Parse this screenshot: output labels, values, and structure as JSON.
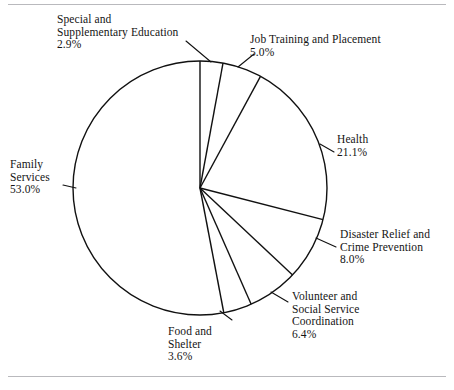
{
  "figure": {
    "background": "#ffffff",
    "stroke_color": "#111111",
    "rule_color": "#b9b9bd"
  },
  "chart_data": {
    "type": "pie",
    "title": "",
    "subtitle": "",
    "xlabel": "",
    "ylabel": "",
    "legend_position": "none",
    "grid": false,
    "units": "percent",
    "start_angle_deg": 0,
    "direction": "clockwise",
    "filled": false,
    "total": 100.0,
    "categories": [
      "Special and Supplementary Education",
      "Job Training and Placement",
      "Health",
      "Disaster Relief and Crime Prevention",
      "Volunteer and Social Service Coordination",
      "Food and Shelter",
      "Family Services"
    ],
    "values": [
      2.9,
      5.0,
      21.1,
      8.0,
      6.4,
      3.6,
      53.0
    ],
    "slices": [
      {
        "name": "Special and Supplementary Education",
        "value": 2.9,
        "value_label": "2.9%",
        "label_lines": [
          "Special and",
          "Supplementary Education"
        ],
        "start_deg": 0.0,
        "end_deg": 10.44
      },
      {
        "name": "Job Training and Placement",
        "value": 5.0,
        "value_label": "5.0%",
        "label_lines": [
          "Job Training and Placement"
        ],
        "start_deg": 10.44,
        "end_deg": 28.44
      },
      {
        "name": "Health",
        "value": 21.1,
        "value_label": "21.1%",
        "label_lines": [
          "Health"
        ],
        "start_deg": 28.44,
        "end_deg": 104.4
      },
      {
        "name": "Disaster Relief and Crime Prevention",
        "value": 8.0,
        "value_label": "8.0%",
        "label_lines": [
          "Disaster Relief and",
          "Crime Prevention"
        ],
        "start_deg": 104.4,
        "end_deg": 133.2
      },
      {
        "name": "Volunteer and Social Service Coordination",
        "value": 6.4,
        "value_label": "6.4%",
        "label_lines": [
          "Volunteer and",
          "Social Service",
          "Coordination"
        ],
        "start_deg": 133.2,
        "end_deg": 156.24
      },
      {
        "name": "Food and Shelter",
        "value": 3.6,
        "value_label": "3.6%",
        "label_lines": [
          "Food and",
          "Shelter"
        ],
        "start_deg": 156.24,
        "end_deg": 169.2
      },
      {
        "name": "Family Services",
        "value": 53.0,
        "value_label": "53.0%",
        "label_lines": [
          "Family",
          "Services"
        ],
        "start_deg": 169.2,
        "end_deg": 360.0
      }
    ]
  },
  "labels": {
    "special": {
      "line1": "Special and",
      "line2": "Supplementary Education",
      "pct": "2.9%"
    },
    "job": {
      "line1": "Job Training and Placement",
      "pct": "5.0%"
    },
    "health": {
      "line1": "Health",
      "pct": "21.1%"
    },
    "family": {
      "line1": "Family",
      "line2": "Services",
      "pct": "53.0%"
    },
    "disaster": {
      "line1": "Disaster Relief and",
      "line2": "Crime Prevention",
      "pct": "8.0%"
    },
    "volunteer": {
      "line1": "Volunteer and",
      "line2": "Social Service",
      "line3": "Coordination",
      "pct": "6.4%"
    },
    "food": {
      "line1": "Food and",
      "line2": "Shelter",
      "pct": "3.6%"
    }
  }
}
